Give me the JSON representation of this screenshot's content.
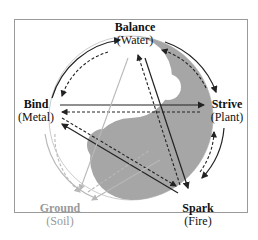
{
  "diagram": {
    "nodes": [
      {
        "id": "balance",
        "name": "Balance",
        "element": "(Water)"
      },
      {
        "id": "strive",
        "name": "Strive",
        "element": "(Plant)"
      },
      {
        "id": "spark",
        "name": "Spark",
        "element": "(Fire)"
      },
      {
        "id": "ground",
        "name": "Ground",
        "element": "(Soil)"
      },
      {
        "id": "bind",
        "name": "Bind",
        "element": "(Metal)"
      }
    ],
    "colors": {
      "yin": "#a6a6a6",
      "arrow": "#222222",
      "ground_arrow": "#b8b8b8",
      "ground_text": "#9a9a9a"
    }
  }
}
